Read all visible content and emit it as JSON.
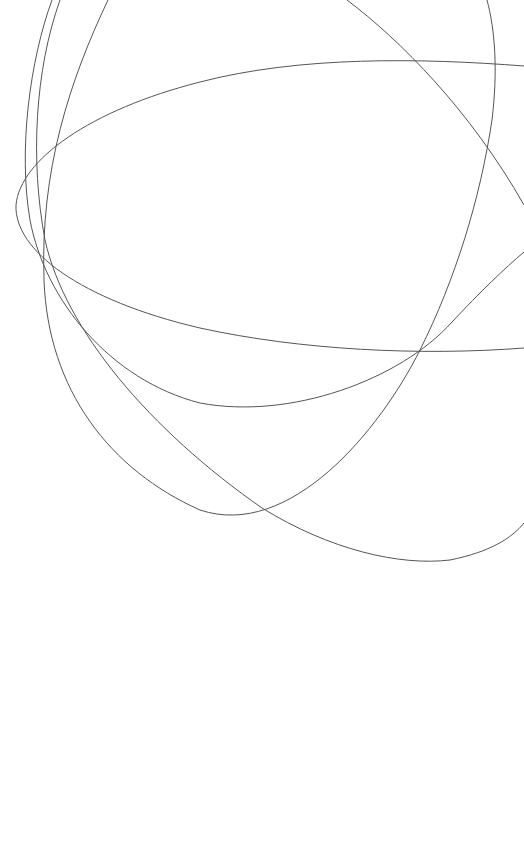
{
  "canvas": {
    "width": 524,
    "height": 857,
    "background": "#ffffff",
    "stroke_color": "#555555"
  },
  "curves": [
    {
      "id": "curve-ellipse-horizontal",
      "d": "M 524 66 C 420 58, 300 56, 200 82 C 90 110, 20 160, 16 205 C 14 250, 80 300, 200 328 C 300 350, 420 356, 524 348"
    },
    {
      "id": "curve-left-bowl-upper",
      "d": "M 52 0 C 30 60, 18 150, 30 220 C 45 300, 110 380, 200 403 C 290 420, 400 380, 452 322 C 480 292, 505 268, 524 252"
    },
    {
      "id": "curve-left-bowl-lower",
      "d": "M 108 0 C 70 80, 40 170, 44 280 C 48 390, 110 470, 200 510 C 290 540, 380 430, 420 350 C 455 280, 480 200, 492 120 C 498 70, 495 30, 487 0"
    },
    {
      "id": "curve-diagonal-long",
      "d": "M 347 0 C 400 40, 470 110, 524 205"
    },
    {
      "id": "curve-large-sweep",
      "d": "M 60 0 C 35 70, 30 160, 45 240 C 65 330, 150 430, 262 508 C 330 550, 400 566, 450 560 C 490 552, 512 538, 524 523"
    }
  ]
}
